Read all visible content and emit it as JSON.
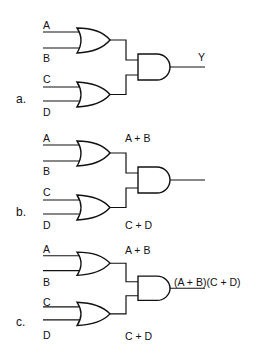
{
  "panels": [
    {
      "id": "a",
      "label": "a.",
      "inputs": [
        "A",
        "B",
        "C",
        "D"
      ],
      "or_outputs": [
        "",
        ""
      ],
      "and_output": "Y",
      "offset_y": 0
    },
    {
      "id": "b",
      "label": "b.",
      "inputs": [
        "A",
        "B",
        "C",
        "D"
      ],
      "or_outputs": [
        "A + B",
        "C + D"
      ],
      "and_output": "",
      "offset_y": 113
    },
    {
      "id": "c",
      "label": "c.",
      "inputs": [
        "A",
        "B",
        "C",
        "D"
      ],
      "or_outputs": [
        "A + B",
        "C + D"
      ],
      "and_output": "(A + B)(C + D)",
      "offset_y": 226
    }
  ],
  "colors": {
    "line": "#111111",
    "background": "#ffffff"
  }
}
